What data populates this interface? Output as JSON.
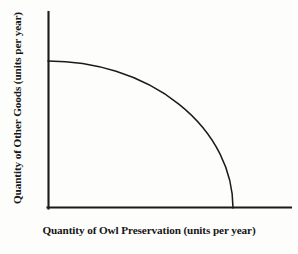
{
  "figure": {
    "kind": "production-possibility-frontier",
    "background_color": "#fdfdfc",
    "ink_color": "#1a1a1a"
  },
  "axes": {
    "x_label": "Quantity of Owl Preservation (units per year)",
    "y_label": "Quantity of Other Goods (units per year)",
    "origin_px": {
      "x": 48,
      "y": 208
    },
    "x_axis_end_px": {
      "x": 291,
      "y": 208
    },
    "y_axis_top_px": {
      "x": 48,
      "y": 12
    },
    "x_tick_labels": [],
    "y_tick_labels": [],
    "grid": false
  },
  "chart_data": {
    "type": "line",
    "title": "",
    "subtitle": "",
    "xlabel": "Quantity of Owl Preservation (units per year)",
    "ylabel": "Quantity of Other Goods (units per year)",
    "xlim": [
      0,
      1.31
    ],
    "ylim": [
      0,
      1.33
    ],
    "grid": false,
    "legend": null,
    "annotations": [],
    "series": [
      {
        "name": "Production Possibility Frontier",
        "shape": "concave quarter-ellipse",
        "x_intercept": 1.0,
        "y_intercept": 1.0,
        "x": [
          0.0,
          0.1,
          0.2,
          0.3,
          0.4,
          0.5,
          0.6,
          0.7,
          0.8,
          0.87,
          0.93,
          0.97,
          0.99,
          1.0
        ],
        "y": [
          1.0,
          0.995,
          0.98,
          0.954,
          0.917,
          0.866,
          0.8,
          0.714,
          0.6,
          0.493,
          0.368,
          0.243,
          0.141,
          0.0
        ]
      }
    ]
  },
  "curve_geometry": {
    "ellipse_center_px": {
      "x": 48,
      "y": 208
    },
    "radius_x_px": 185,
    "radius_y_px": 147,
    "path": "M 48 61 A 185 147 0 0 1 233 208"
  }
}
